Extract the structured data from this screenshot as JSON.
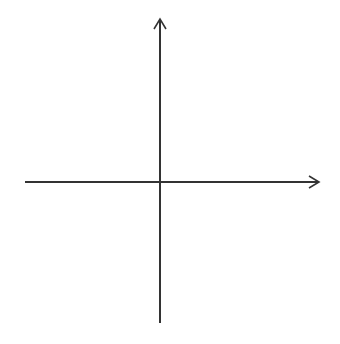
{
  "diagram": {
    "type": "cartesian-coordinate-grid",
    "x_axis": {
      "label": "x",
      "min": -6,
      "max": 6,
      "tick_labels": [
        "-5",
        "-4",
        "-3",
        "-2",
        "-1",
        "1",
        "2",
        "3",
        "4",
        "5"
      ]
    },
    "y_axis": {
      "label": "y",
      "min": -6,
      "max": 6,
      "tick_labels": [
        "5",
        "4",
        "3",
        "2",
        "1",
        "-1",
        "-2",
        "-3",
        "-4",
        "-5"
      ]
    },
    "grid": {
      "style": "dotted",
      "cells_x": 12,
      "cells_y": 12
    },
    "colors": {
      "axis": "#333333",
      "grid": "#9a9a9a",
      "text": "#2a2a2a",
      "background": "#ffffff"
    }
  },
  "labels": {
    "x_axis_name": "x",
    "y_axis_name": "y",
    "x_neg": [
      "−5",
      "−4",
      "−3",
      "−2",
      "−1"
    ],
    "x_pos": [
      "1",
      "2",
      "3",
      "4",
      "5"
    ],
    "y_pos": [
      "5",
      "4",
      "3",
      "2",
      "1"
    ],
    "y_neg": [
      "−1",
      "−2",
      "−3",
      "−4",
      "−5"
    ]
  }
}
